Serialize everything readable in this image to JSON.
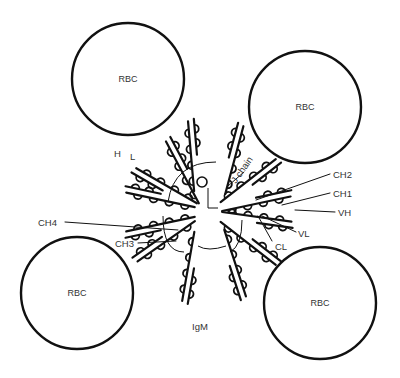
{
  "diagram": {
    "title": "IgM",
    "cells": [
      {
        "label": "RBC",
        "cx": 128,
        "cy": 79,
        "r": 56
      },
      {
        "label": "RBC",
        "cx": 305,
        "cy": 107,
        "r": 56
      },
      {
        "label": "RBC",
        "cx": 77,
        "cy": 293,
        "r": 56
      },
      {
        "label": "RBC",
        "cx": 320,
        "cy": 303,
        "r": 56
      }
    ],
    "labels": {
      "h": "H",
      "l": "L",
      "j_chain": "J chain",
      "ch2": "CH2",
      "ch1": "CH1",
      "vh": "VH",
      "ch4": "CH4",
      "ch3": "CH3",
      "vl": "VL",
      "cl": "CL",
      "igm": "IgM"
    },
    "colors": {
      "line": "#111111",
      "text": "#333333",
      "background": "#ffffff"
    }
  }
}
